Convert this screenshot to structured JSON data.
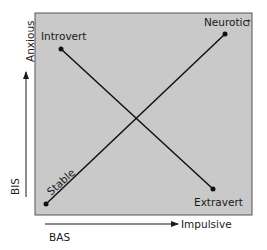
{
  "diagram": {
    "type": "personality-dimensions",
    "box_fill": "#c9c9c9",
    "line_color": "#111111",
    "axes": {
      "y": {
        "label_low": "BIS",
        "label_high": "Anxious"
      },
      "x": {
        "label_low": "BAS",
        "label_high": "Impulsive"
      }
    },
    "points": {
      "introvert": {
        "label": "Introvert",
        "x": 61,
        "y": 49
      },
      "neurotic": {
        "label": "Neurotic",
        "arrow": "↑",
        "x": 225,
        "y": 34
      },
      "stable": {
        "label": "Stable",
        "x": 46,
        "y": 204
      },
      "extravert": {
        "label": "Extravert",
        "x": 213,
        "y": 189
      }
    },
    "lines": [
      {
        "from": "introvert",
        "to": "extravert"
      },
      {
        "from": "stable",
        "to": "neurotic"
      }
    ]
  }
}
